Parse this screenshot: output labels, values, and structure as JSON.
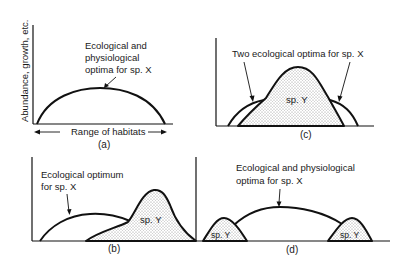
{
  "figure": {
    "y_axis_label": "Abundance, growth, etc.",
    "x_axis_label": "Range of habitats",
    "panels": [
      {
        "id": "a",
        "caption": "(a)",
        "annotation_lines": [
          "Ecological and",
          "physiological",
          "optima for sp. X"
        ],
        "curves": [
          "sp. X"
        ]
      },
      {
        "id": "b",
        "caption": "(b)",
        "annotation_lines": [
          "Ecological optimum",
          "for sp. X"
        ],
        "species_label": "sp. Y",
        "curves": [
          "sp. X",
          "sp. Y"
        ]
      },
      {
        "id": "c",
        "caption": "(c)",
        "annotation_lines": [
          "Two ecological optima for sp. X"
        ],
        "species_label": "sp. Y",
        "curves": [
          "sp. X",
          "sp. Y"
        ]
      },
      {
        "id": "d",
        "caption": "(d)",
        "annotation_lines": [
          "Ecological and physiological",
          "optima for sp. X"
        ],
        "species_labels": [
          "sp. Y",
          "sp. Y"
        ],
        "curves": [
          "sp. X",
          "sp. Y",
          "sp. Y"
        ]
      }
    ]
  },
  "colors": {
    "ink": "#111111",
    "stipple": "#9a9a9a",
    "background": "#ffffff"
  }
}
